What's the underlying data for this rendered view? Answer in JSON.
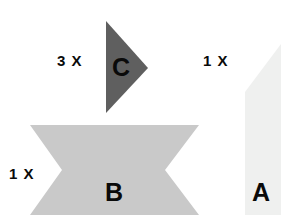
{
  "figure": {
    "width": 281,
    "height": 224,
    "background_color": "#ffffff"
  },
  "shapes": [
    {
      "id": "shape-c",
      "letter": "C",
      "kind": "right-pointing-triangle",
      "fill": "#5f5f5f",
      "multiplier": "3 X",
      "points": "106,21 148,68 106,113"
    },
    {
      "id": "shape-b",
      "letter": "B",
      "kind": "horizontal-bowtie-ribbon",
      "fill": "#c9c9c9",
      "multiplier": "1 X",
      "points": "30,125 199,125 165,170 199,215 30,215 62,170"
    },
    {
      "id": "shape-a",
      "letter": "A",
      "kind": "clipped-pentagon",
      "fill": "#eff0ef",
      "multiplier": "1 X",
      "points": "245,92 281,44 281,215 245,215"
    }
  ],
  "labels": {
    "letter_c": "C",
    "letter_b": "B",
    "letter_a": "A",
    "multiplier_c": "3 X",
    "multiplier_b": "1 X",
    "multiplier_a": "1 X"
  },
  "colors": {
    "dark_gray": "#5f5f5f",
    "mid_gray": "#c9c9c9",
    "light_gray": "#eff0ef",
    "text_black": "#0a0a0a",
    "background": "#ffffff"
  }
}
